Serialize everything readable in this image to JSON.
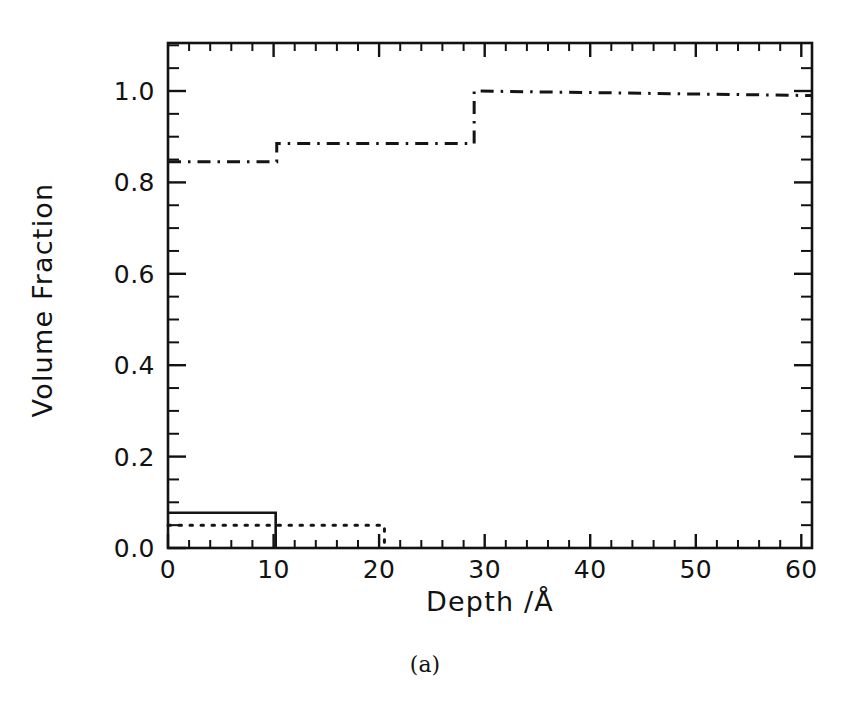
{
  "figure": {
    "caption": "(a)"
  },
  "chart_data": {
    "type": "line",
    "title": "",
    "subtitle": "",
    "xlabel": "Depth /Å",
    "ylabel": "Volume Fraction",
    "xlim": [
      0,
      61
    ],
    "ylim": [
      0.0,
      1.1
    ],
    "grid": false,
    "legend": "none",
    "x_major_ticks": [
      0,
      10,
      20,
      30,
      40,
      50,
      60
    ],
    "x_tick_labels": [
      "0",
      "10",
      "20",
      "30",
      "40",
      "50",
      "60"
    ],
    "x_minor_interval": 2,
    "y_major_ticks": [
      0.0,
      0.2,
      0.4,
      0.6,
      0.8,
      1.0
    ],
    "y_tick_labels": [
      "0.0",
      "0.2",
      "0.4",
      "0.6",
      "0.8",
      "1.0"
    ],
    "y_minor_interval": 0.05,
    "series": [
      {
        "name": "polymer-profile-dashdot",
        "style": "dash-dot",
        "color": "#141414",
        "step": "post",
        "x": [
          0,
          10.3,
          10.3,
          29.0,
          29.0,
          61.0
        ],
        "y": [
          0.845,
          0.845,
          0.885,
          0.885,
          1.0,
          0.99
        ],
        "steps": [
          {
            "x_start": 0,
            "x_end": 10.3,
            "value": 0.845
          },
          {
            "x_start": 10.3,
            "x_end": 29.0,
            "value": 0.885
          },
          {
            "x_start": 29.0,
            "x_end": 61.0,
            "value": 1.0
          }
        ]
      },
      {
        "name": "surface-layer-solid",
        "style": "solid",
        "color": "#141414",
        "step": "post",
        "x": [
          0,
          10.2,
          10.2,
          10.2
        ],
        "y": [
          0.077,
          0.077,
          0.0,
          0.0
        ],
        "steps": [
          {
            "x_start": 0,
            "x_end": 10.2,
            "value": 0.077
          }
        ]
      },
      {
        "name": "second-layer-dotted",
        "style": "dotted",
        "color": "#141414",
        "step": "post",
        "x": [
          0,
          20.5,
          20.5
        ],
        "y": [
          0.05,
          0.05,
          0.0
        ],
        "steps": [
          {
            "x_start": 0,
            "x_end": 20.5,
            "value": 0.05
          }
        ]
      }
    ]
  }
}
